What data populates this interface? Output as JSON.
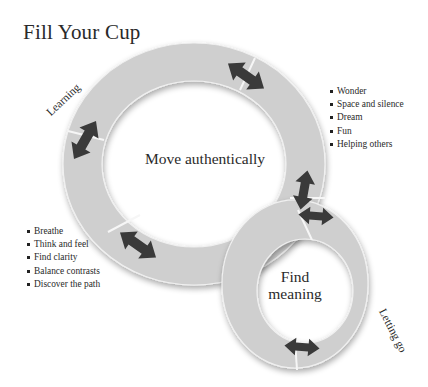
{
  "title": "Fill Your Cup",
  "main_cycle": {
    "label": "Move authentically",
    "ring_label": "Learning"
  },
  "small_cycle": {
    "label_line1": "Find",
    "label_line2": "meaning",
    "ring_label": "Letting go"
  },
  "right_list": [
    "Wonder",
    "Space and silence",
    "Dream",
    "Fun",
    "Helping others"
  ],
  "left_list": [
    "Breathe",
    "Think and feel",
    "Find clarity",
    "Balance contrasts",
    "Discover the path"
  ],
  "colors": {
    "ring": "#cfcfcf",
    "ring_edge": "#f4f4f4",
    "arrow": "#3a3a3a",
    "text": "#2a2a2a"
  },
  "icons": {
    "arrow": "double-headed-arrow"
  }
}
